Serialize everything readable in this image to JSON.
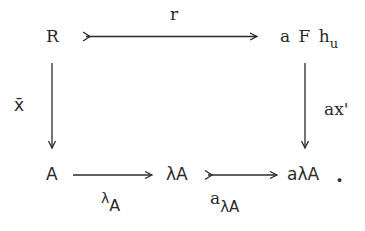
{
  "diagram": {
    "type": "commutative-square",
    "nodes": {
      "top_left": "R",
      "top_right": {
        "base": "a F h",
        "subscript": "u"
      },
      "bottom_left": "A",
      "bottom_middle": "λA",
      "bottom_right": "aλA",
      "terminal_punctuation": "."
    },
    "arrows": {
      "top": {
        "from": "R",
        "to": "a F h_u",
        "label": "r",
        "style": "monomorphism"
      },
      "left": {
        "from": "R",
        "to": "A",
        "label": "x̄",
        "style": "plain"
      },
      "right": {
        "from": "a F h_u",
        "to": "aλA",
        "label": "ax'",
        "style": "plain"
      },
      "bottom_first": {
        "from": "A",
        "to": "λA",
        "label_base": "λ",
        "label_subscript": "A",
        "style": "plain"
      },
      "bottom_second": {
        "from": "λA",
        "to": "aλA",
        "label_base": "a",
        "label_subscript": "λA",
        "style": "monomorphism"
      }
    },
    "colors": {
      "ink": "#2a2a2a",
      "background": "#ffffff"
    }
  }
}
